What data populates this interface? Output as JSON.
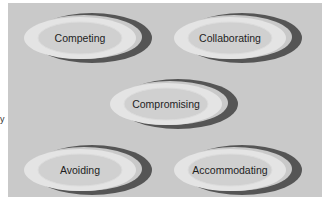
{
  "diagram": {
    "title": "",
    "left_fragment": "y",
    "nodes": [
      {
        "id": "competing",
        "label": "Competing"
      },
      {
        "id": "collaborating",
        "label": "Collaborating"
      },
      {
        "id": "compromising",
        "label": "Compromising"
      },
      {
        "id": "avoiding",
        "label": "Avoiding"
      },
      {
        "id": "accommodating",
        "label": "Accommodating"
      }
    ],
    "colors": {
      "panel": "#c9c9c9",
      "crescent": "#555555",
      "outer_ring": "#e6e6e6",
      "inner": "#d2d2d2",
      "text": "#1e1e1e"
    }
  }
}
